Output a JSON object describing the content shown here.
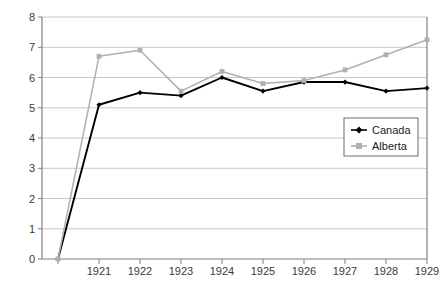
{
  "chart_data": {
    "type": "line",
    "title": "",
    "subtitle": "",
    "xlabel": "",
    "ylabel": "",
    "categories": [
      "",
      "1921",
      "1922",
      "1923",
      "1924",
      "1925",
      "1926",
      "1927",
      "1928",
      "1929"
    ],
    "tick_labels_x": [
      "1921",
      "1922",
      "1923",
      "1924",
      "1925",
      "1926",
      "1927",
      "1928",
      "1929"
    ],
    "tick_labels_y": [
      "0",
      "1",
      "2",
      "3",
      "4",
      "5",
      "6",
      "7",
      "8"
    ],
    "ylim": [
      0,
      8
    ],
    "ytick_step": 1,
    "grid": "horizontal",
    "legend_position": "center-right",
    "series": [
      {
        "name": "Canada",
        "color": "#000000",
        "marker": "diamond",
        "values": [
          0,
          5.1,
          5.5,
          5.4,
          6.0,
          5.55,
          5.85,
          5.85,
          5.55,
          5.65
        ]
      },
      {
        "name": "Alberta",
        "color": "#b0b0b0",
        "marker": "square",
        "values": [
          0,
          6.7,
          6.9,
          5.55,
          6.2,
          5.8,
          5.9,
          6.25,
          6.75,
          7.25
        ]
      }
    ],
    "axis_color": "#808080",
    "grid_color": "#c8c8c8",
    "plot_border_color": "#808080"
  },
  "legend": {
    "entries": [
      {
        "label": "Canada"
      },
      {
        "label": "Alberta"
      }
    ]
  }
}
